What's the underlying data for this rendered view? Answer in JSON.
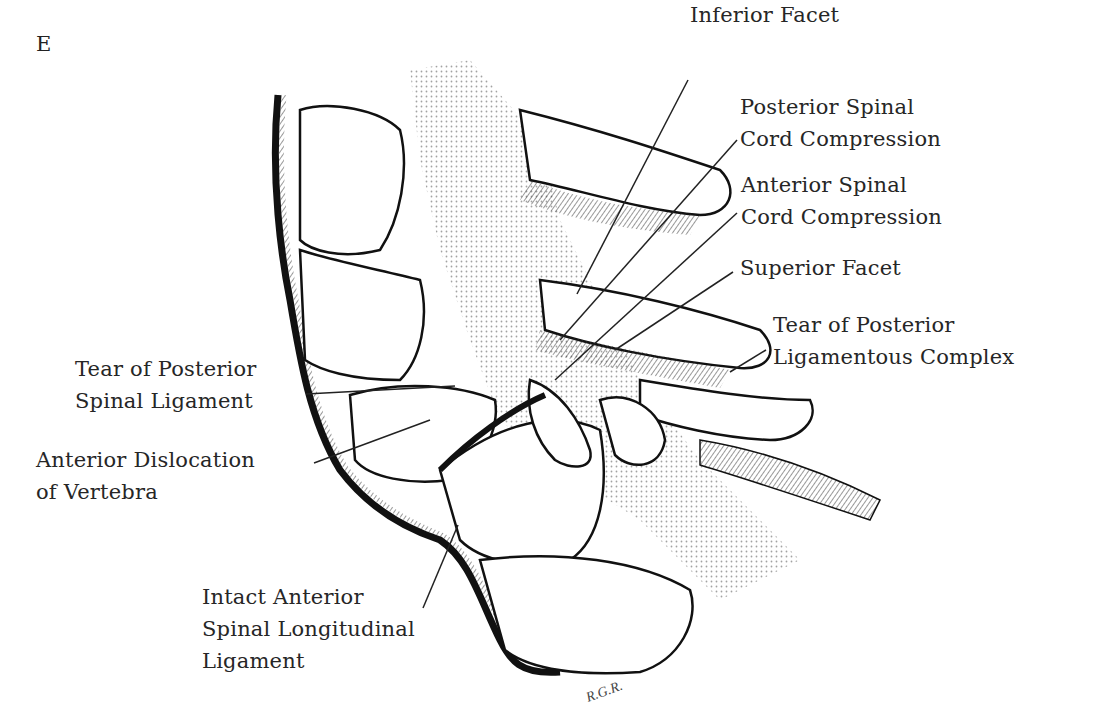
{
  "figure": {
    "panel_letter": "E",
    "signature": "R.G.R.",
    "labels": {
      "inferior_facet": [
        "Inferior Facet"
      ],
      "posterior_cord_compression": [
        "Posterior Spinal",
        "Cord Compression"
      ],
      "anterior_cord_compression": [
        "Anterior Spinal",
        "Cord Compression"
      ],
      "superior_facet": [
        "Superior Facet"
      ],
      "tear_posterior_ligamentous_complex": [
        "Tear of Posterior",
        "Ligamentous Complex"
      ],
      "tear_posterior_spinal_ligament": [
        "Tear of Posterior",
        "Spinal Ligament"
      ],
      "anterior_dislocation": [
        "Anterior Dislocation",
        "of Vertebra"
      ],
      "intact_anterior_ligament": [
        "Intact Anterior",
        "Spinal Longitudinal",
        "Ligament"
      ]
    }
  }
}
